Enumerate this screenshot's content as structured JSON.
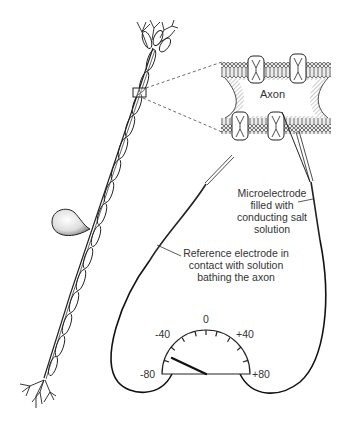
{
  "labels": {
    "axon": "Axon",
    "microelectrode": [
      "Microelectrode",
      "filled with",
      "conducting salt",
      "solution"
    ],
    "reference": [
      "Reference electrode in",
      "contact with solution",
      "bathing the axon"
    ]
  },
  "meter": {
    "ticks": [
      "-80",
      "-40",
      "0",
      "+40",
      "+80"
    ],
    "reading": "-60"
  }
}
